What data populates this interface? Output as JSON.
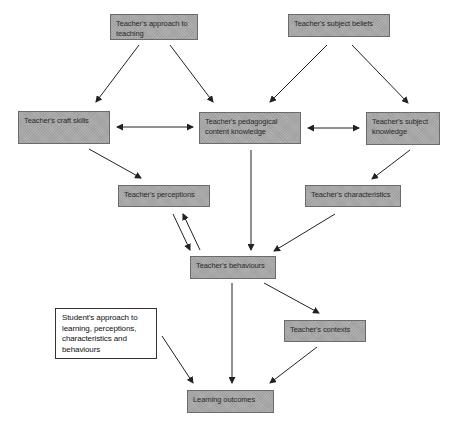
{
  "diagram": {
    "nodes": [
      {
        "id": "approach",
        "label": "Teacher's approach to teaching"
      },
      {
        "id": "beliefs",
        "label": "Teacher's subject beliefs"
      },
      {
        "id": "craft",
        "label": "Teacher's craft skills"
      },
      {
        "id": "pck",
        "label": "Teacher's pedagogical content knowledge"
      },
      {
        "id": "subject_knowledge",
        "label": "Teacher's subject knowledge"
      },
      {
        "id": "perceptions",
        "label": "Teacher's perceptions"
      },
      {
        "id": "characteristics",
        "label": "Teacher's characteristics"
      },
      {
        "id": "behaviours",
        "label": "Teacher's behaviours"
      },
      {
        "id": "student",
        "label": "Student's approach to learning, perceptions, characteristics and behaviours"
      },
      {
        "id": "contexts",
        "label": "Teacher's contexts"
      },
      {
        "id": "outcomes",
        "label": "Learning outcomes"
      }
    ],
    "edges": [
      {
        "from": "approach",
        "to": "craft",
        "type": "directed"
      },
      {
        "from": "approach",
        "to": "pck",
        "type": "directed"
      },
      {
        "from": "beliefs",
        "to": "pck",
        "type": "directed"
      },
      {
        "from": "beliefs",
        "to": "subject_knowledge",
        "type": "directed"
      },
      {
        "from": "craft",
        "to": "pck",
        "type": "bidirectional"
      },
      {
        "from": "pck",
        "to": "subject_knowledge",
        "type": "bidirectional"
      },
      {
        "from": "craft",
        "to": "perceptions",
        "type": "directed"
      },
      {
        "from": "subject_knowledge",
        "to": "characteristics",
        "type": "directed"
      },
      {
        "from": "perceptions",
        "to": "behaviours",
        "type": "directed"
      },
      {
        "from": "behaviours",
        "to": "perceptions",
        "type": "directed"
      },
      {
        "from": "pck",
        "to": "behaviours",
        "type": "directed"
      },
      {
        "from": "characteristics",
        "to": "behaviours",
        "type": "directed"
      },
      {
        "from": "behaviours",
        "to": "contexts",
        "type": "directed"
      },
      {
        "from": "behaviours",
        "to": "outcomes",
        "type": "directed"
      },
      {
        "from": "student",
        "to": "outcomes",
        "type": "directed"
      },
      {
        "from": "contexts",
        "to": "outcomes",
        "type": "directed"
      }
    ]
  },
  "colors": {
    "node_fill": "#a9a9a9",
    "node_border": "#6b6b6b",
    "plain_node_fill": "#ffffff",
    "arrow": "#222222"
  }
}
